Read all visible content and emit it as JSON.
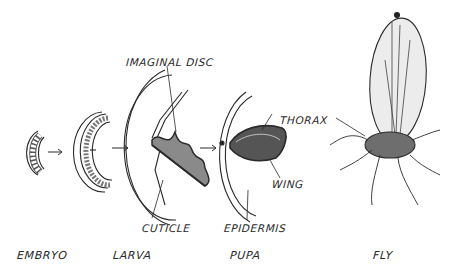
{
  "stages": [
    {
      "name": "embryo",
      "label": "EMBRYO"
    },
    {
      "name": "larva",
      "label": "LARVA"
    },
    {
      "name": "pupa",
      "label": "PUPA"
    },
    {
      "name": "fly",
      "label": "FLY"
    }
  ],
  "annotations": {
    "imaginal_disc": "IMAGINAL DISC",
    "cuticle": "CUTICLE",
    "epidermis": "EPIDERMIS",
    "thorax": "THORAX",
    "wing": "WING"
  },
  "colors": {
    "ink": "#2a2a2a",
    "disc_fill": "#8a8a8a",
    "body_fill": "#6e6e6e",
    "wing_fill": "#ececec"
  }
}
